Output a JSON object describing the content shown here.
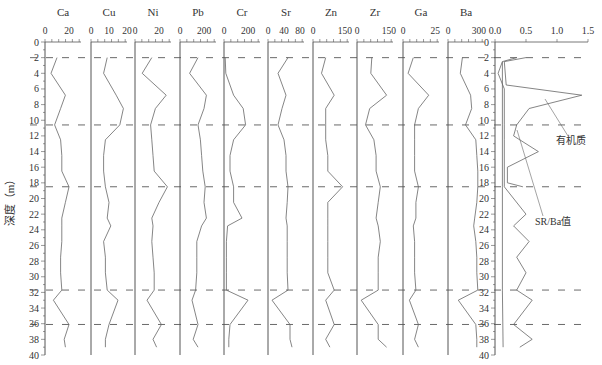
{
  "chart_data": {
    "type": "line",
    "title": "",
    "ylabel": "深度（m）",
    "ylim": [
      0,
      40
    ],
    "y_ticks": [
      0,
      2,
      4,
      6,
      8,
      10,
      12,
      14,
      16,
      18,
      20,
      22,
      24,
      26,
      28,
      30,
      32,
      34,
      36,
      38,
      40
    ],
    "y_inverted": true,
    "boundary_depths": [
      2.0,
      10.6,
      18.5,
      31.7,
      36.1
    ],
    "depths": [
      2.0,
      4.0,
      6.8,
      8.5,
      10.6,
      12.5,
      14.5,
      16.5,
      18.5,
      20.5,
      22.5,
      23.5,
      25.5,
      27.5,
      29.5,
      31.7,
      33.0,
      36.1,
      38.0,
      39.0
    ],
    "panels": [
      {
        "name": "Ca",
        "ticks": [
          0,
          20
        ],
        "xlim": [
          0,
          30
        ],
        "values": [
          10,
          5,
          17,
          13,
          8,
          13,
          14,
          14,
          20,
          17,
          14,
          14,
          14,
          13,
          13,
          14,
          7,
          20,
          16,
          17
        ]
      },
      {
        "name": "Cu",
        "ticks": [
          0,
          10,
          20
        ],
        "xlim": [
          0,
          20
        ],
        "values": [
          9,
          7,
          14,
          18,
          16,
          8,
          7,
          7,
          8,
          10,
          9,
          11,
          7,
          8,
          8,
          9,
          15,
          10,
          8,
          8
        ]
      },
      {
        "name": "Ni",
        "ticks": [
          0,
          20
        ],
        "xlim": [
          0,
          30
        ],
        "values": [
          14,
          6,
          26,
          17,
          13,
          14,
          15,
          16,
          27,
          20,
          14,
          15,
          14,
          15,
          16,
          16,
          10,
          22,
          15,
          18
        ]
      },
      {
        "name": "Pb",
        "ticks": [
          0,
          200
        ],
        "xlim": [
          0,
          300
        ],
        "values": [
          150,
          80,
          220,
          200,
          150,
          170,
          180,
          190,
          210,
          200,
          220,
          180,
          140,
          140,
          140,
          130,
          100,
          150,
          110,
          150
        ]
      },
      {
        "name": "Cr",
        "ticks": [
          0,
          200
        ],
        "xlim": [
          0,
          300
        ],
        "values": [
          10,
          15,
          80,
          160,
          180,
          80,
          50,
          50,
          80,
          80,
          150,
          30,
          20,
          20,
          20,
          20,
          200,
          50,
          40,
          40
        ]
      },
      {
        "name": "Sr",
        "ticks": [
          0,
          40,
          80
        ],
        "xlim": [
          0,
          90
        ],
        "values": [
          50,
          25,
          45,
          35,
          25,
          40,
          45,
          45,
          50,
          48,
          45,
          48,
          48,
          48,
          48,
          50,
          10,
          55,
          55,
          60
        ]
      },
      {
        "name": "Zn",
        "ticks": [
          0,
          150
        ],
        "xlim": [
          0,
          170
        ],
        "values": [
          60,
          40,
          100,
          60,
          60,
          60,
          70,
          70,
          140,
          70,
          70,
          70,
          70,
          70,
          70,
          100,
          60,
          100,
          60,
          80
        ]
      },
      {
        "name": "Zr",
        "ticks": [
          0,
          150
        ],
        "xlim": [
          0,
          170
        ],
        "values": [
          70,
          65,
          140,
          60,
          40,
          80,
          90,
          90,
          110,
          100,
          90,
          100,
          110,
          100,
          100,
          100,
          20,
          100,
          100,
          140
        ]
      },
      {
        "name": "Ga",
        "ticks": [
          0,
          25
        ],
        "xlim": [
          0,
          28
        ],
        "values": [
          8,
          4,
          20,
          12,
          9,
          9,
          9,
          9,
          12,
          10,
          10,
          8,
          9,
          9,
          9,
          10,
          5,
          12,
          9,
          12
        ]
      },
      {
        "name": "Ba",
        "ticks": [
          0,
          300
        ],
        "xlim": [
          0,
          350
        ],
        "values": [
          140,
          120,
          220,
          230,
          170,
          270,
          280,
          290,
          290,
          280,
          260,
          250,
          270,
          280,
          280,
          290,
          100,
          270,
          280,
          280
        ]
      }
    ],
    "right_panel": {
      "ticks": [
        0.0,
        0.5,
        1.0,
        1.5
      ],
      "xlim": [
        0,
        1.5
      ],
      "series": [
        {
          "name": "有机质",
          "depths": [
            2.0,
            2.5,
            5.5,
            6.8,
            8.5,
            10.6,
            12.0,
            14.0,
            16.0,
            18.0,
            18.5
          ],
          "values": [
            0.5,
            0.15,
            0.18,
            1.4,
            0.55,
            0.35,
            0.3,
            0.7,
            0.2,
            0.2,
            0.45
          ]
        },
        {
          "name": "SR/Ba值",
          "depths": [
            2.0,
            2.5,
            4.0,
            6.0,
            10.6,
            12.5,
            18.5,
            22.0,
            23.5,
            25.5,
            27.5,
            29.5,
            31.7,
            33.0,
            36.1,
            38.0,
            39.0
          ],
          "values": [
            0.35,
            0.12,
            0.05,
            0.15,
            0.15,
            0.15,
            0.15,
            0.5,
            0.3,
            0.55,
            0.35,
            0.5,
            0.35,
            0.6,
            0.3,
            0.6,
            0.4
          ]
        },
        {
          "name": "baseline",
          "depths": [
            2.5,
            10.6,
            18.5,
            31.7,
            39.0
          ],
          "values": [
            0.12,
            0.12,
            0.12,
            0.12,
            0.13
          ]
        }
      ],
      "annotations": [
        {
          "text": "有机质",
          "x": 556,
          "y": 144
        },
        {
          "text": "SR/Ba值",
          "x": 535,
          "y": 225
        }
      ]
    }
  }
}
